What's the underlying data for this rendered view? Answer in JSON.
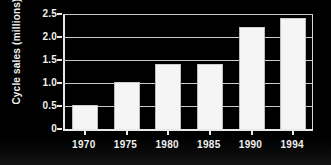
{
  "chart_data": {
    "type": "bar",
    "title": "",
    "xlabel": "",
    "ylabel": "Cycle sales (millions)",
    "categories": [
      "1970",
      "1975",
      "1980",
      "1985",
      "1990",
      "1994"
    ],
    "values": [
      0.5,
      1.0,
      1.4,
      1.4,
      2.2,
      2.4
    ],
    "ylim": [
      0,
      2.5
    ],
    "ytick_labels": [
      "0",
      "0.5",
      "1.0",
      "1.5",
      "2.0",
      "2.5"
    ],
    "ytick_values": [
      0,
      0.5,
      1.0,
      1.5,
      2.0,
      2.5
    ],
    "grid": true,
    "legend": false,
    "colors": {
      "background": "#000000",
      "bar_fill": "#f5f5f5",
      "axis": "#e8e8e8",
      "gridline": "#c9c9c9",
      "text": "#f0f0f0"
    }
  }
}
